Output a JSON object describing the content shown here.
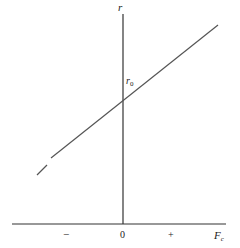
{
  "diagram": {
    "y_axis_label": "r",
    "x_axis_label": "F",
    "x_axis_subscript": "c",
    "intercept_label": "r",
    "intercept_subscript": "0",
    "origin_label": "0",
    "negative_label": "−",
    "positive_label": "+",
    "line_color": "#555555",
    "axis_color": "#333333"
  }
}
